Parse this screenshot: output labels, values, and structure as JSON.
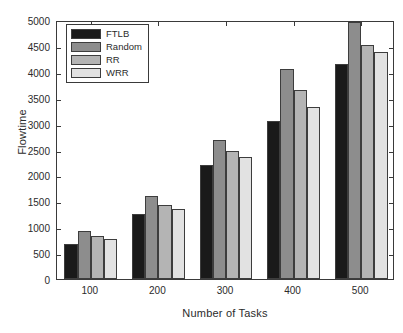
{
  "chart_data": {
    "type": "bar",
    "title": "",
    "xlabel": "Number of Tasks",
    "ylabel": "Flowtime",
    "categories": [
      "100",
      "200",
      "300",
      "400",
      "500"
    ],
    "series": [
      {
        "name": "FTLB",
        "color": "#1a1a1a",
        "values": [
          680,
          1250,
          2200,
          3060,
          4150
        ]
      },
      {
        "name": "Random",
        "color": "#8d8d8d",
        "values": [
          930,
          1600,
          2690,
          4050,
          4970
        ]
      },
      {
        "name": "RR",
        "color": "#b4b4b4",
        "values": [
          830,
          1420,
          2480,
          3640,
          4520
        ]
      },
      {
        "name": "WRR",
        "color": "#e2e2e2",
        "values": [
          770,
          1360,
          2350,
          3330,
          4380
        ]
      }
    ],
    "ylim": [
      0,
      5000
    ],
    "yticks": [
      0,
      500,
      1000,
      1500,
      2000,
      2500,
      3000,
      3500,
      4000,
      4500,
      5000
    ],
    "ytick_labels": [
      "0",
      "500",
      "1000",
      "1500",
      "2000",
      "2500",
      "3000",
      "3500",
      "4000",
      "4500",
      "5000"
    ],
    "grid": false,
    "legend_position": "upper-left",
    "legend_entries": [
      "FTLB",
      "Random",
      "RR",
      "WRR"
    ],
    "axis_color": "#3a3a3a",
    "background": "#ffffff"
  }
}
